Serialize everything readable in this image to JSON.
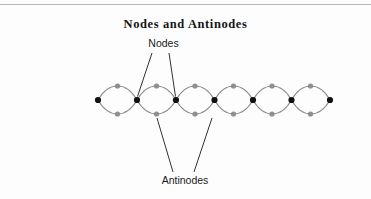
{
  "page": {
    "background_color": "#fdfdfd",
    "width": 371,
    "height": 199,
    "top_rule_color": "#b9b9b9"
  },
  "figure": {
    "title": "Nodes and Antinodes",
    "title_color": "#151515",
    "labels": {
      "nodes": "Nodes",
      "antinodes": "Antinodes"
    },
    "label_color": "#1b1b1b"
  },
  "chart_data": {
    "type": "line",
    "title": "Nodes and Antinodes",
    "subtitle": "",
    "xlabel": "",
    "ylabel": "",
    "grid": false,
    "legend_position": "none",
    "axis_y": 100,
    "amplitude": 14,
    "loop_count": 6,
    "wave_stroke_color": "#8d8d8d",
    "wave_stroke_width": 1.1,
    "node_marker": {
      "name": "node",
      "color": "#111111",
      "radius": 3.1,
      "count": 7,
      "x": [
        98,
        137,
        176,
        214.5,
        253,
        291.5,
        330
      ],
      "y": [
        100,
        100,
        100,
        100,
        100,
        100,
        100
      ]
    },
    "antinode_marker": {
      "name": "antinode",
      "color": "#8f8f8f",
      "radius": 2.6,
      "count": 12,
      "crest_x": [
        117.5,
        156.5,
        195,
        233.5,
        272,
        310.5
      ],
      "crest_y": [
        86,
        86,
        86,
        86,
        86,
        86
      ],
      "trough_x": [
        117.5,
        156.5,
        195,
        233.5,
        272,
        310.5
      ],
      "trough_y": [
        114,
        114,
        114,
        114,
        114,
        114
      ]
    },
    "annotations": [
      {
        "text": "Nodes",
        "text_x": 163,
        "text_y": 46,
        "leaders": [
          {
            "from_x": 152,
            "from_y": 53,
            "to_x": 137.5,
            "to_y": 96.5
          },
          {
            "from_x": 169,
            "from_y": 53,
            "to_x": 175.5,
            "to_y": 96.5
          }
        ]
      },
      {
        "text": "Antinodes",
        "text_x": 185,
        "text_y": 183,
        "leaders": [
          {
            "from_x": 173,
            "from_y": 172,
            "to_x": 157,
            "to_y": 118
          },
          {
            "from_x": 194,
            "from_y": 172,
            "to_x": 212,
            "to_y": 118
          }
        ]
      }
    ]
  }
}
